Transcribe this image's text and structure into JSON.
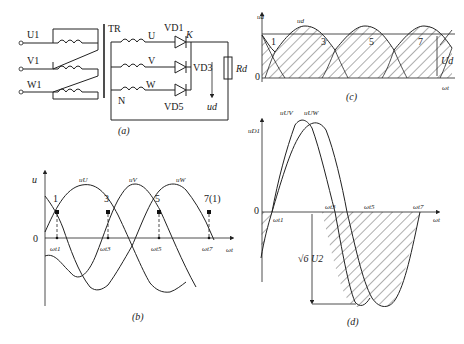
{
  "panels": {
    "a": {
      "caption": "(a)",
      "inputs": [
        "U1",
        "V1",
        "W1"
      ],
      "transformer_label": "TR",
      "secondary_phases": [
        "U",
        "V",
        "W"
      ],
      "neutral_label": "N",
      "diodes": [
        "VD1",
        "VD3",
        "VD5"
      ],
      "cathode_node": "K",
      "load_label": "Rd",
      "output_voltage_label": "ud"
    },
    "b": {
      "caption": "(b)",
      "y_label": "u",
      "x_label": "ωt",
      "origin_label": "0",
      "curve_labels": [
        "uU",
        "uV",
        "uW"
      ],
      "points": [
        "1",
        "3",
        "5",
        "7(1)"
      ],
      "ticks": [
        "ωt1",
        "ωt3",
        "ωt5",
        "ωt7"
      ]
    },
    "c": {
      "caption": "(c)",
      "y_label": "ud",
      "x_label": "ωt",
      "origin_label": "0",
      "curve_label": "ud",
      "points": [
        "1",
        "3",
        "5",
        "7"
      ],
      "avg_label": "Ud"
    },
    "d": {
      "caption": "(d)",
      "y_label": "uD1",
      "x_label": "ωt",
      "origin_label": "0",
      "curve_labels": [
        "uUV",
        "uUW"
      ],
      "ticks": [
        "ωt1",
        "ωt3",
        "ωt5",
        "ωt7"
      ],
      "peak_label": "√6 U2"
    }
  }
}
